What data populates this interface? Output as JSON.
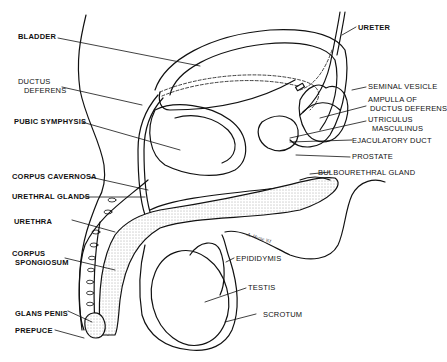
{
  "diagram": {
    "signature": "A. Horse '61",
    "labels": {
      "bladder": "BLADDER",
      "ductus_deferens_1": "DUCTUS",
      "ductus_deferens_2": "DEFERENS",
      "pubic_symphysis": "PUBIC SYMPHYSIS",
      "corpus_cavernosa": "CORPUS CAVERNOSA",
      "urethral_glands": "URETHRAL GLANDS",
      "urethra": "URETHRA",
      "corpus_spongiosum_1": "CORPUS",
      "corpus_spongiosum_2": "SPONGIOSUM",
      "glans_penis": "GLANS PENIS",
      "prepuce": "PREPUCE",
      "ureter": "URETER",
      "seminal_vesicle": "SEMINAL VESICLE",
      "ampulla_1": "AMPULLA OF",
      "ampulla_2": "DUCTUS DEFERENS",
      "utriculus_1": "UTRICULUS",
      "utriculus_2": "MASCULINUS",
      "ejaculatory_duct": "EJACULATORY DUCT",
      "prostate": "PROSTATE",
      "bulbourethral_gland": "BULBOURETHRAL GLAND",
      "epididymis": "EPIDIDYMIS",
      "testis": "TESTIS",
      "scrotum": "SCROTUM"
    },
    "colors": {
      "line": "#111111",
      "background": "#ffffff",
      "stipple": "#e6e6e6"
    }
  }
}
